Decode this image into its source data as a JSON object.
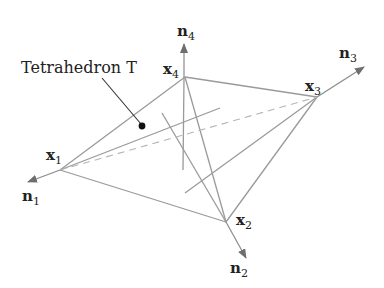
{
  "diagram": {
    "title_label": "Tetrahedron T",
    "vertices": [
      {
        "name": "x",
        "sub": "1"
      },
      {
        "name": "x",
        "sub": "2"
      },
      {
        "name": "x",
        "sub": "3"
      },
      {
        "name": "x",
        "sub": "4"
      }
    ],
    "normals": [
      {
        "name": "n",
        "sub": "1"
      },
      {
        "name": "n",
        "sub": "2"
      },
      {
        "name": "n",
        "sub": "3"
      },
      {
        "name": "n",
        "sub": "4"
      }
    ],
    "colors": {
      "edge": "#9a9a9a",
      "arrow": "#6e6e6e",
      "text": "#222222",
      "dot": "#111111"
    }
  }
}
